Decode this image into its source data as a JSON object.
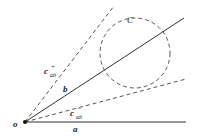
{
  "diagram": {
    "origin_label": "o",
    "line_a_label": "a",
    "line_b_label": "b",
    "circle_label": "C",
    "upper_tangent_label": "c",
    "upper_tangent_sub": "ab",
    "upper_tangent_sup": "+",
    "lower_tangent_label": "c",
    "lower_tangent_sub": "ab",
    "lower_tangent_sup": "−",
    "colors": {
      "stroke": "#333333",
      "background": "#ffffff"
    }
  }
}
